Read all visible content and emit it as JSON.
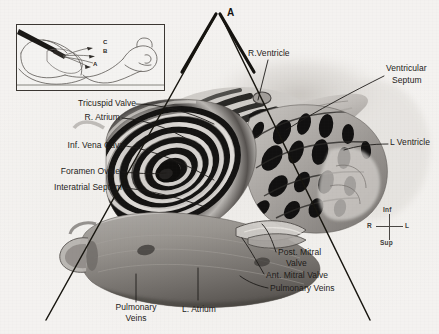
{
  "figure": {
    "background_color": "#f1efec",
    "ink_color": "#1d1b19"
  },
  "apex_marker": {
    "label": "A"
  },
  "inset": {
    "plane_labels": [
      "C",
      "B",
      "A"
    ],
    "description_visible_text": ""
  },
  "labels": [
    {
      "name": "tricuspid-valve",
      "text": "Tricuspid Valve",
      "align": "right"
    },
    {
      "name": "right-atrium",
      "text": "R. Atrium",
      "align": "right"
    },
    {
      "name": "inferior-vena-cava",
      "text": "Inf. Vena Cava",
      "align": "right"
    },
    {
      "name": "foramen-ovale",
      "text": "Foramen Ovale",
      "align": "right"
    },
    {
      "name": "interatrial-septum",
      "text": "Interatrial Septum",
      "align": "right"
    },
    {
      "name": "right-ventricle",
      "text": "R.Ventricle",
      "align": "left"
    },
    {
      "name": "ventricular-septum",
      "text": "Ventricular\nSeptum",
      "align": "left"
    },
    {
      "name": "left-ventricle",
      "text": "L Ventricle",
      "align": "left"
    },
    {
      "name": "posterior-mitral-valve",
      "text": "Post. Mitral\nValve",
      "align": "left"
    },
    {
      "name": "anterior-mitral-valve",
      "text": "Ant. Mitral Valve",
      "align": "left"
    },
    {
      "name": "pulmonary-veins-right",
      "text": "Pulmonary Veins",
      "align": "left"
    },
    {
      "name": "pulmonary-veins-left",
      "text": "Pulmonary\nVeins",
      "align": "center"
    },
    {
      "name": "left-atrium",
      "text": "L. Atrium",
      "align": "center"
    }
  ],
  "label_text": {
    "tricuspid_valve": "Tricuspid Valve",
    "right_atrium": "R. Atrium",
    "inferior_vena_cava": "Inf. Vena Cava",
    "foramen_ovale": "Foramen Ovale",
    "interatrial_septum": "Interatrial Septum",
    "right_ventricle": "R.Ventricle",
    "ventricular_septum_line1": "Ventricular",
    "ventricular_septum_line2": "Septum",
    "left_ventricle": "L Ventricle",
    "post_mitral_valve_line1": "Post. Mitral",
    "post_mitral_valve_line2": "Valve",
    "ant_mitral_valve": "Ant. Mitral Valve",
    "pulmonary_veins_right": "Pulmonary Veins",
    "pulmonary_veins_left_line1": "Pulmonary",
    "pulmonary_veins_left_line2": "Veins",
    "left_atrium": "L. Atrium"
  },
  "compass": {
    "top": "Inf",
    "left": "R",
    "right": "L",
    "bottom": "Sup"
  }
}
